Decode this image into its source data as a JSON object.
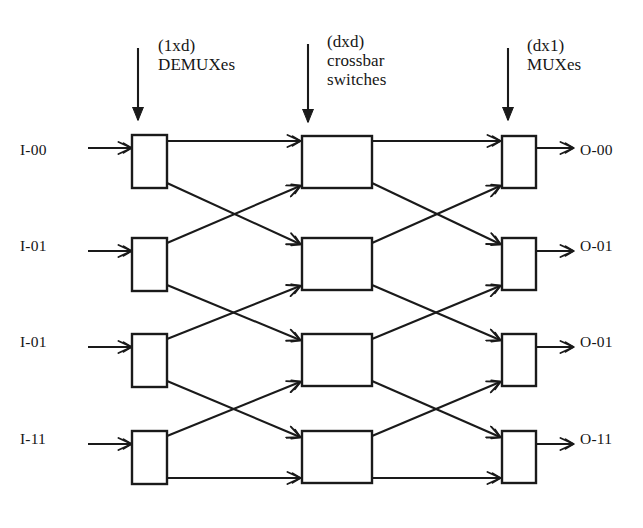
{
  "diagram": {
    "stroke_color": "#1a1a1a",
    "background_color": "#ffffff",
    "stage_headings": [
      {
        "id": "demux",
        "line1": "(1xd)",
        "line2": "DEMUXes",
        "x": 158,
        "y": 36,
        "arrow_x": 138,
        "arrow_y0": 48,
        "arrow_y1": 120
      },
      {
        "id": "crossbar",
        "line1": "(dxd)",
        "line2": "crossbar",
        "line3": "switches",
        "x": 327,
        "y": 32,
        "arrow_x": 308,
        "arrow_y0": 44,
        "arrow_y1": 122
      },
      {
        "id": "mux",
        "line1": "(dx1)",
        "line2": "MUXes",
        "x": 527,
        "y": 36,
        "arrow_x": 508,
        "arrow_y0": 48,
        "arrow_y1": 120
      }
    ],
    "inputs": [
      {
        "label": "I-00",
        "x": 30,
        "y": 152
      },
      {
        "label": "I-01",
        "x": 30,
        "y": 248
      },
      {
        "label": "I-01",
        "x": 30,
        "y": 344
      },
      {
        "label": "I-11",
        "x": 30,
        "y": 441
      }
    ],
    "outputs": [
      {
        "label": "O-00",
        "x": 580,
        "y": 152
      },
      {
        "label": "O-01",
        "x": 580,
        "y": 248
      },
      {
        "label": "O-01",
        "x": 580,
        "y": 344
      },
      {
        "label": "O-11",
        "x": 580,
        "y": 441
      }
    ],
    "boxes": {
      "demux": [
        {
          "x": 132,
          "y": 135,
          "w": 35,
          "h": 53
        },
        {
          "x": 132,
          "y": 238,
          "w": 35,
          "h": 53
        },
        {
          "x": 132,
          "y": 334,
          "w": 35,
          "h": 53
        },
        {
          "x": 132,
          "y": 431,
          "w": 35,
          "h": 53
        }
      ],
      "crossbar": [
        {
          "x": 302,
          "y": 136,
          "w": 70,
          "h": 52
        },
        {
          "x": 302,
          "y": 238,
          "w": 70,
          "h": 52
        },
        {
          "x": 302,
          "y": 334,
          "w": 70,
          "h": 52
        },
        {
          "x": 302,
          "y": 431,
          "w": 70,
          "h": 52
        }
      ],
      "mux": [
        {
          "x": 502,
          "y": 136,
          "w": 34,
          "h": 52
        },
        {
          "x": 502,
          "y": 238,
          "w": 34,
          "h": 52
        },
        {
          "x": 502,
          "y": 334,
          "w": 34,
          "h": 52
        },
        {
          "x": 502,
          "y": 431,
          "w": 34,
          "h": 52
        }
      ]
    },
    "input_arrows": [
      {
        "x0": 88,
        "y0": 148,
        "x1": 131,
        "y1": 148
      },
      {
        "x0": 88,
        "y0": 251,
        "x1": 131,
        "y1": 251
      },
      {
        "x0": 88,
        "y0": 347,
        "x1": 131,
        "y1": 347
      },
      {
        "x0": 88,
        "y0": 444,
        "x1": 131,
        "y1": 444
      }
    ],
    "output_arrows": [
      {
        "x0": 536,
        "y0": 148,
        "x1": 573,
        "y1": 148
      },
      {
        "x0": 536,
        "y0": 251,
        "x1": 573,
        "y1": 251
      },
      {
        "x0": 536,
        "y0": 347,
        "x1": 573,
        "y1": 347
      },
      {
        "x0": 536,
        "y0": 444,
        "x1": 573,
        "y1": 444
      }
    ],
    "links_stage1": [
      {
        "from": "demux-0",
        "to": "crossbar-0",
        "x0": 167,
        "y0": 141,
        "x1": 300,
        "y1": 141
      },
      {
        "from": "demux-0",
        "to": "crossbar-1",
        "x0": 167,
        "y0": 183,
        "x1": 300,
        "y1": 244
      },
      {
        "from": "demux-1",
        "to": "crossbar-0",
        "x0": 167,
        "y0": 243,
        "x1": 300,
        "y1": 186
      },
      {
        "from": "demux-1",
        "to": "crossbar-2",
        "x0": 167,
        "y0": 285,
        "x1": 300,
        "y1": 340
      },
      {
        "from": "demux-2",
        "to": "crossbar-1",
        "x0": 167,
        "y0": 339,
        "x1": 300,
        "y1": 286
      },
      {
        "from": "demux-2",
        "to": "crossbar-3",
        "x0": 167,
        "y0": 381,
        "x1": 300,
        "y1": 437
      },
      {
        "from": "demux-3",
        "to": "crossbar-2",
        "x0": 167,
        "y0": 436,
        "x1": 300,
        "y1": 382
      },
      {
        "from": "demux-3",
        "to": "crossbar-3",
        "x0": 167,
        "y0": 478,
        "x1": 300,
        "y1": 478
      }
    ],
    "links_stage2": [
      {
        "from": "crossbar-0",
        "to": "mux-0",
        "x0": 372,
        "y0": 141,
        "x1": 500,
        "y1": 141
      },
      {
        "from": "crossbar-0",
        "to": "mux-1",
        "x0": 372,
        "y0": 183,
        "x1": 500,
        "y1": 244
      },
      {
        "from": "crossbar-1",
        "to": "mux-0",
        "x0": 372,
        "y0": 243,
        "x1": 500,
        "y1": 186
      },
      {
        "from": "crossbar-1",
        "to": "mux-2",
        "x0": 372,
        "y0": 285,
        "x1": 500,
        "y1": 340
      },
      {
        "from": "crossbar-2",
        "to": "mux-1",
        "x0": 372,
        "y0": 339,
        "x1": 500,
        "y1": 286
      },
      {
        "from": "crossbar-2",
        "to": "mux-3",
        "x0": 372,
        "y0": 381,
        "x1": 500,
        "y1": 437
      },
      {
        "from": "crossbar-3",
        "to": "mux-2",
        "x0": 372,
        "y0": 436,
        "x1": 500,
        "y1": 382
      },
      {
        "from": "crossbar-3",
        "to": "mux-3",
        "x0": 372,
        "y0": 478,
        "x1": 500,
        "y1": 478
      }
    ]
  }
}
